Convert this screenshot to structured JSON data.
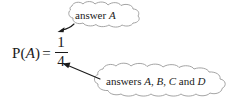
{
  "figure": {
    "background_color": "#ffffff",
    "ink_color": "#1a1a1a",
    "cloud_outline_color": "#9a9a9a",
    "arrow_color": "#1a1a1a"
  },
  "equation": {
    "probability_symbol": "P(",
    "event_variable": "A",
    "close_paren": ")",
    "equals": "=",
    "numerator": "1",
    "denominator": "4",
    "full_text": "P(A) = 1/4"
  },
  "callouts": [
    {
      "id": "top",
      "shape": "cloud",
      "text_prefix": "answer ",
      "text_italic": "A",
      "text_suffix": "",
      "full_text": "answer A",
      "points_to": "numerator"
    },
    {
      "id": "bottom",
      "shape": "cloud",
      "text_prefix": "answers ",
      "text_italic": "A",
      "text_mid1": ", ",
      "text_italic2": "B",
      "text_mid2": ", ",
      "text_italic3": "C",
      "text_mid3": " and ",
      "text_italic4": "D",
      "full_text": "answers A, B, C and D",
      "points_to": "denominator"
    }
  ]
}
